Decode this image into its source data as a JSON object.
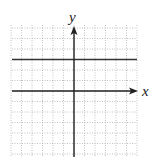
{
  "chart_data": {
    "type": "line",
    "title": "",
    "xlabel": "x",
    "ylabel": "y",
    "xlim": [
      -6,
      6
    ],
    "ylim": [
      -6,
      6
    ],
    "grid": true,
    "grid_style": "dotted",
    "series": [
      {
        "name": "y = 3",
        "x": [
          -6,
          6
        ],
        "values": [
          3,
          3
        ]
      }
    ]
  },
  "labels": {
    "x_axis": "x",
    "y_axis": "y"
  },
  "colors": {
    "grid": "#b0b0b0",
    "axis": "#222222",
    "line": "#333333"
  }
}
